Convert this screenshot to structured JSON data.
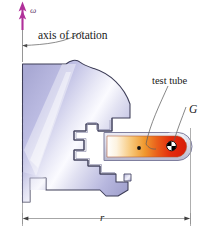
{
  "figure": {
    "background": "#ffffff",
    "width": 207,
    "height": 245
  },
  "labels": {
    "omega": "ω",
    "axis_of_rotation": "axis of rotation",
    "test_tube": "test tube",
    "center_of_mass": "G",
    "radius": "r"
  },
  "colors": {
    "omega_arrow": "#b0309a",
    "rotor_fill_light": "#ffffff",
    "rotor_fill_mid": "#b9b9e0",
    "rotor_fill_dark": "#9a9acb",
    "rotor_outline": "#3a3a55",
    "tube_shell": "#d6d6e6",
    "tube_shell_outline": "#8a8aa8",
    "tube_hot": "#e8230f",
    "tube_warm": "#f08a2a",
    "tube_cool": "#ffffff",
    "leader_line": "#555555",
    "dimension_line": "#777777",
    "text": "#1a1a1a"
  },
  "elements": {
    "axis_line": "vertical dashed-solid axis at left of rotor",
    "rotor": "sectioned lavender centrifuge rotor body",
    "holder": "notched tube holder cavity",
    "tube": "horizontal test tube with thermal gradient fill",
    "com_marker": "quartered black and white circle at G",
    "sample_dot": "small black dot inside tube",
    "dimension_r": "radius dimension from axis to tube tip"
  }
}
